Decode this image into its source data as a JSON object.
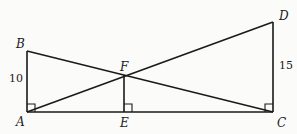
{
  "diagram": {
    "points": {
      "A": {
        "label": "A",
        "x": 27,
        "y": 112
      },
      "B": {
        "label": "B",
        "x": 27,
        "y": 51
      },
      "C": {
        "label": "C",
        "x": 273,
        "y": 112
      },
      "D": {
        "label": "D",
        "x": 273,
        "y": 22
      },
      "E": {
        "label": "E",
        "x": 124,
        "y": 112
      },
      "F": {
        "label": "F",
        "x": 124,
        "y": 75
      }
    },
    "segments": [
      "AB",
      "AC",
      "CD",
      "BC",
      "AD",
      "FE"
    ],
    "right_angles": [
      "A",
      "E",
      "C"
    ],
    "measures": {
      "AB": "10",
      "CD": "15"
    }
  }
}
